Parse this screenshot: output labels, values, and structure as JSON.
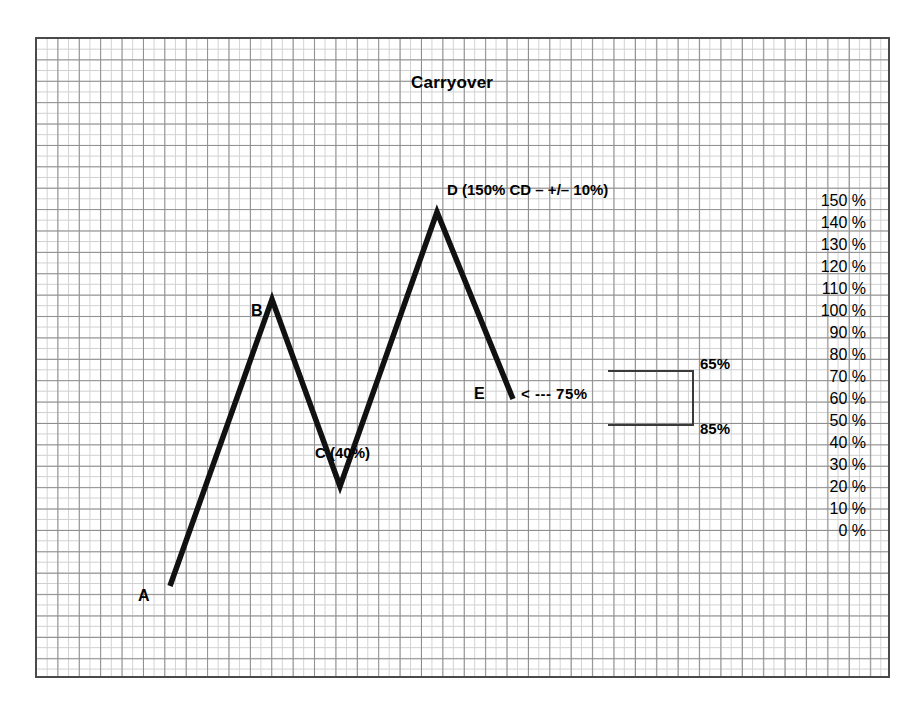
{
  "chart_data": {
    "type": "line",
    "title": "Carryover",
    "xlabel": "",
    "ylabel": "",
    "ylim": [
      0,
      150
    ],
    "grid": true,
    "legend_position": "none",
    "axis_side": "right",
    "categories": [
      "A",
      "B",
      "C",
      "D",
      "E"
    ],
    "values": [
      0,
      115,
      40,
      150,
      75
    ],
    "series": [
      {
        "name": "Carryover",
        "values": [
          0,
          115,
          40,
          150,
          75
        ]
      }
    ],
    "y_ticks": [
      "150 %",
      "140 %",
      "130 %",
      "120 %",
      "110 %",
      "100 %",
      "90 %",
      "80 %",
      "70 %",
      "60 %",
      "50 %",
      "40 %",
      "30 %",
      "20 %",
      "10 %",
      "0 %"
    ],
    "point_labels": {
      "a": "A",
      "b": "B",
      "c": "C (40%)",
      "d": "D (150% CD – +/– 10%)",
      "e": "E"
    },
    "annotations": {
      "arrow_note": "< --- 75%",
      "bracket_upper": "65%",
      "bracket_lower": "85%"
    },
    "colors": {
      "line": "#111111",
      "grid_major": "#8d8d8d",
      "grid_minor": "#d2d2d2",
      "frame": "#4a4a4a",
      "text": "#000000",
      "bracket": "#3a3a3a"
    }
  }
}
